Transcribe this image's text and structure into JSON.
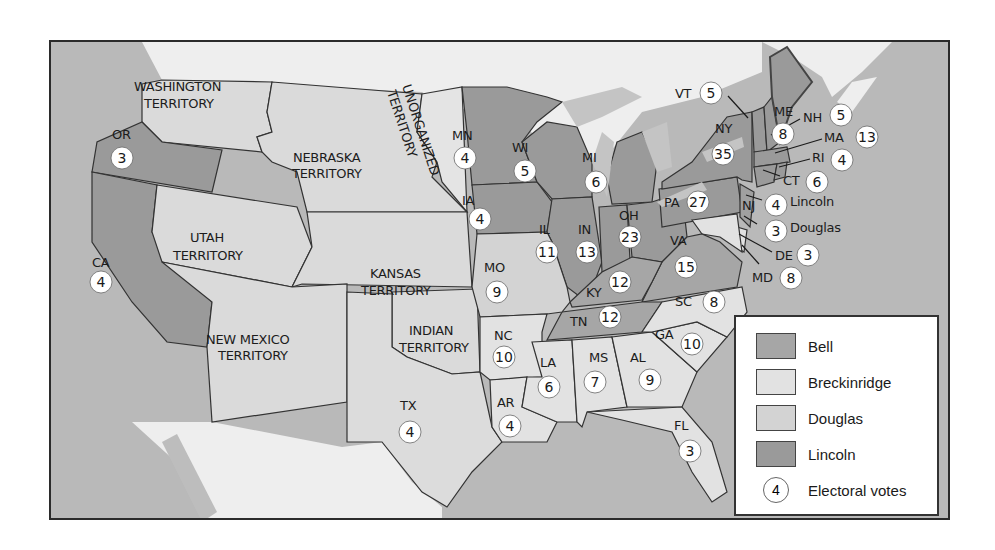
{
  "colors": {
    "bell": "#a6a6a6",
    "breckinridge": "#e2e2e2",
    "douglas": "#d3d3d3",
    "lincoln": "#9a9a9a",
    "water": "#b7b7b7",
    "foreign": "#eeeeee",
    "territory": "#dadada"
  },
  "legend": {
    "items": [
      {
        "label": "Bell",
        "key": "bell"
      },
      {
        "label": "Breckinridge",
        "key": "breckinridge"
      },
      {
        "label": "Douglas",
        "key": "douglas"
      },
      {
        "label": "Lincoln",
        "key": "lincoln"
      }
    ],
    "electoral_symbol_value": "4",
    "electoral_label": "Electoral votes"
  },
  "territories": [
    {
      "name": "WASHINGTON TERRITORY",
      "lines": [
        "WASHINGTON",
        "TERRITORY"
      ]
    },
    {
      "name": "NEBRASKA TERRITORY",
      "lines": [
        "NEBRASKA",
        "TERRITORY"
      ]
    },
    {
      "name": "UNORGANIZED TERRITORY",
      "lines": [
        "UNORGANIZED",
        "TERRITORY"
      ]
    },
    {
      "name": "UTAH TERRITORY",
      "lines": [
        "UTAH",
        "TERRITORY"
      ]
    },
    {
      "name": "KANSAS TERRITORY",
      "lines": [
        "KANSAS",
        "TERRITORY"
      ]
    },
    {
      "name": "NEW MEXICO TERRITORY",
      "lines": [
        "NEW MEXICO",
        "TERRITORY"
      ]
    },
    {
      "name": "INDIAN TERRITORY",
      "lines": [
        "INDIAN",
        "TERRITORY"
      ]
    }
  ],
  "states": [
    {
      "abbr": "OR",
      "ev": "3",
      "winner": "lincoln"
    },
    {
      "abbr": "CA",
      "ev": "4",
      "winner": "lincoln"
    },
    {
      "abbr": "MN",
      "ev": "4",
      "winner": "lincoln"
    },
    {
      "abbr": "IA",
      "ev": "4",
      "winner": "lincoln"
    },
    {
      "abbr": "WI",
      "ev": "5",
      "winner": "lincoln"
    },
    {
      "abbr": "MI",
      "ev": "6",
      "winner": "lincoln"
    },
    {
      "abbr": "IL",
      "ev": "11",
      "winner": "lincoln"
    },
    {
      "abbr": "IN",
      "ev": "13",
      "winner": "lincoln"
    },
    {
      "abbr": "OH",
      "ev": "23",
      "winner": "lincoln"
    },
    {
      "abbr": "PA",
      "ev": "27",
      "winner": "lincoln"
    },
    {
      "abbr": "NY",
      "ev": "35",
      "winner": "lincoln"
    },
    {
      "abbr": "VT",
      "ev": "5",
      "winner": "lincoln"
    },
    {
      "abbr": "ME",
      "ev": "8",
      "winner": "lincoln"
    },
    {
      "abbr": "NH",
      "ev": "5",
      "winner": "lincoln"
    },
    {
      "abbr": "MA",
      "ev": "13",
      "winner": "lincoln"
    },
    {
      "abbr": "RI",
      "ev": "4",
      "winner": "lincoln"
    },
    {
      "abbr": "CT",
      "ev": "6",
      "winner": "lincoln"
    },
    {
      "abbr": "NJ",
      "ev_split": [
        {
          "ev": "4",
          "candidate": "Lincoln"
        },
        {
          "ev": "3",
          "candidate": "Douglas"
        }
      ],
      "winner": "lincoln"
    },
    {
      "abbr": "DE",
      "ev": "3",
      "winner": "breckinridge"
    },
    {
      "abbr": "MD",
      "ev": "8",
      "winner": "breckinridge"
    },
    {
      "abbr": "VA",
      "ev": "15",
      "winner": "bell"
    },
    {
      "abbr": "KY",
      "ev": "12",
      "winner": "bell"
    },
    {
      "abbr": "TN",
      "ev": "12",
      "winner": "bell"
    },
    {
      "abbr": "MO",
      "ev": "9",
      "winner": "douglas"
    },
    {
      "abbr": "NC",
      "ev": "10",
      "winner": "breckinridge"
    },
    {
      "abbr": "SC",
      "ev": "8",
      "winner": "breckinridge"
    },
    {
      "abbr": "GA",
      "ev": "10",
      "winner": "breckinridge"
    },
    {
      "abbr": "AL",
      "ev": "9",
      "winner": "breckinridge"
    },
    {
      "abbr": "MS",
      "ev": "7",
      "winner": "breckinridge"
    },
    {
      "abbr": "LA",
      "ev": "6",
      "winner": "breckinridge"
    },
    {
      "abbr": "AR",
      "ev": "4",
      "winner": "breckinridge"
    },
    {
      "abbr": "TX",
      "ev": "4",
      "winner": "breckinridge"
    },
    {
      "abbr": "FL",
      "ev": "3",
      "winner": "breckinridge"
    }
  ]
}
